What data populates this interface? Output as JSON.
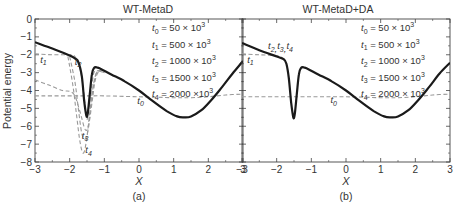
{
  "chart_data": [
    {
      "panel": "a",
      "type": "line",
      "title": "WT-MetaD",
      "caption": "(a)",
      "xlabel": "X",
      "ylabel": "Potential energy",
      "xlim": [
        -3,
        3
      ],
      "ylim": [
        -8,
        0
      ],
      "xticks": [
        -3,
        -2,
        -1,
        0,
        1,
        2,
        3
      ],
      "yticks": [
        0,
        -1,
        -2,
        -3,
        -4,
        -5,
        -6,
        -7,
        -8
      ],
      "grid": false,
      "legend": {
        "position": "upper right (text only)",
        "entries": [
          {
            "sym": "t",
            "sub": "0",
            "text": " = 50 × 10",
            "sup": "3"
          },
          {
            "sym": "t",
            "sub": "1",
            "text": " = 500 × 10",
            "sup": "3"
          },
          {
            "sym": "t",
            "sub": "2",
            "text": " = 1000 × 10",
            "sup": "3"
          },
          {
            "sym": "t",
            "sub": "3",
            "text": " = 1500 × 10",
            "sup": "3"
          },
          {
            "sym": "t",
            "sub": "4",
            "text": " = 2000 ×10",
            "sup": "3"
          }
        ]
      },
      "annotations": [
        {
          "label": "t1",
          "x": -2.85,
          "y": -2.45
        },
        {
          "label": "t2",
          "x": -1.85,
          "y": -2.55
        },
        {
          "label": "t3",
          "x": -1.65,
          "y": -6.7
        },
        {
          "label": "t4",
          "x": -1.55,
          "y": -7.5
        },
        {
          "label": "t0",
          "x": -0.05,
          "y": -4.75
        }
      ],
      "series": [
        {
          "name": "true potential",
          "style": "solid",
          "color": "#1a1a1a",
          "width": 2.2,
          "x": [
            -3.0,
            -2.5,
            -2.0,
            -1.85,
            -1.75,
            -1.65,
            -1.58,
            -1.52,
            -1.48,
            -1.42,
            -1.36,
            -1.3,
            -1.22,
            -1.1,
            -0.8,
            -0.4,
            0.0,
            0.4,
            0.8,
            1.1,
            1.3,
            1.5,
            1.8,
            2.1,
            2.4,
            2.7,
            3.0
          ],
          "y": [
            -1.3,
            -1.65,
            -2.05,
            -2.2,
            -2.4,
            -3.2,
            -4.6,
            -5.4,
            -5.3,
            -4.2,
            -3.1,
            -2.75,
            -2.7,
            -2.8,
            -3.1,
            -3.5,
            -4.0,
            -4.6,
            -5.15,
            -5.45,
            -5.5,
            -5.45,
            -5.1,
            -4.5,
            -3.8,
            -3.05,
            -2.35
          ]
        },
        {
          "name": "t0",
          "style": "dashed",
          "color": "#999999",
          "width": 1.1,
          "x": [
            -3.0,
            -2.0,
            -1.5,
            -1.0,
            0.0,
            1.0,
            1.5,
            2.0,
            2.5,
            3.0
          ],
          "y": [
            -4.3,
            -4.3,
            -4.3,
            -4.3,
            -4.35,
            -4.4,
            -4.4,
            -4.35,
            -4.25,
            -4.2
          ]
        },
        {
          "name": "t1",
          "style": "dashed",
          "color": "#999999",
          "width": 1.1,
          "x": [
            -3.0,
            -2.5,
            -2.0,
            -1.85,
            -1.7,
            -1.6,
            -1.5,
            -1.42,
            -1.35,
            -1.3,
            -1.2,
            -1.0
          ],
          "y": [
            -1.95,
            -2.0,
            -2.0,
            -2.1,
            -2.8,
            -4.0,
            -5.6,
            -4.6,
            -3.6,
            -3.0,
            -2.9,
            -3.0
          ]
        },
        {
          "name": "t2",
          "style": "dashed",
          "color": "#999999",
          "width": 1.1,
          "x": [
            -3.0,
            -2.6,
            -2.2,
            -2.0,
            -1.85,
            -1.7,
            -1.55,
            -1.45,
            -1.35,
            -1.28,
            -1.2,
            -1.1,
            -1.0
          ],
          "y": [
            -3.4,
            -3.7,
            -4.0,
            -4.05,
            -4.3,
            -5.2,
            -6.2,
            -5.9,
            -4.6,
            -3.6,
            -3.05,
            -2.95,
            -3.0
          ]
        },
        {
          "name": "t3",
          "style": "dashed",
          "color": "#999999",
          "width": 1.1,
          "x": [
            -2.0,
            -1.85,
            -1.75,
            -1.65,
            -1.55,
            -1.45,
            -1.38,
            -1.3,
            -1.22,
            -1.1
          ],
          "y": [
            -2.1,
            -3.5,
            -5.0,
            -6.4,
            -6.7,
            -6.0,
            -4.6,
            -3.6,
            -3.0,
            -2.9
          ]
        },
        {
          "name": "t4",
          "style": "dashed",
          "color": "#999999",
          "width": 1.1,
          "x": [
            -2.05,
            -1.9,
            -1.8,
            -1.7,
            -1.6,
            -1.5,
            -1.42,
            -1.34,
            -1.26,
            -1.18,
            -1.05
          ],
          "y": [
            -2.1,
            -3.8,
            -5.4,
            -6.9,
            -7.5,
            -6.6,
            -5.2,
            -4.0,
            -3.2,
            -2.9,
            -2.9
          ]
        }
      ]
    },
    {
      "panel": "b",
      "type": "line",
      "title": "WT-MetaD+DA",
      "caption": "(b)",
      "xlabel": "X",
      "ylabel": "",
      "xlim": [
        -3,
        3
      ],
      "ylim": [
        -8,
        0
      ],
      "xticks": [
        -3,
        -2,
        -1,
        0,
        1,
        2,
        3
      ],
      "yticks": [
        0,
        -1,
        -2,
        -3,
        -4,
        -5,
        -6,
        -7,
        -8
      ],
      "grid": false,
      "legend": {
        "position": "upper right (text only)",
        "entries": [
          {
            "sym": "t",
            "sub": "0",
            "text": " = 50 × 10",
            "sup": "3"
          },
          {
            "sym": "t",
            "sub": "1",
            "text": " = 500 × 10",
            "sup": "3"
          },
          {
            "sym": "t",
            "sub": "2",
            "text": " = 1000 × 10",
            "sup": "3"
          },
          {
            "sym": "t",
            "sub": "3",
            "text": " = 1500 × 10",
            "sup": "3"
          },
          {
            "sym": "t",
            "sub": "4",
            "text": " = 2000 × 10",
            "sup": "3"
          }
        ]
      },
      "annotations": [
        {
          "label": "t2,t3,t4",
          "x": -2.25,
          "y": -1.7
        },
        {
          "label": "t1",
          "x": -2.85,
          "y": -2.45
        },
        {
          "label": "t0",
          "x": -0.45,
          "y": -4.7
        }
      ],
      "series": [
        {
          "name": "t2,t3,t4 (overlapping true potential)",
          "style": "solid",
          "color": "#1a1a1a",
          "width": 2.2,
          "x": [
            -3.0,
            -2.5,
            -2.0,
            -1.8,
            -1.72,
            -1.65,
            -1.58,
            -1.52,
            -1.48,
            -1.42,
            -1.36,
            -1.3,
            -1.22,
            -1.1,
            -0.8,
            -0.4,
            0.0,
            0.4,
            0.8,
            1.1,
            1.3,
            1.5,
            1.8,
            2.1,
            2.4,
            2.7,
            3.0
          ],
          "y": [
            -1.35,
            -1.75,
            -2.1,
            -2.25,
            -2.5,
            -3.3,
            -4.7,
            -5.5,
            -5.35,
            -4.2,
            -3.1,
            -2.75,
            -2.7,
            -2.8,
            -3.1,
            -3.5,
            -4.0,
            -4.6,
            -5.15,
            -5.45,
            -5.5,
            -5.45,
            -5.1,
            -4.5,
            -3.8,
            -3.05,
            -2.45
          ]
        },
        {
          "name": "t0",
          "style": "dashed",
          "color": "#999999",
          "width": 1.1,
          "x": [
            -3.0,
            -2.0,
            -1.0,
            0.0,
            1.0,
            1.5,
            2.0,
            2.5,
            3.0
          ],
          "y": [
            -4.35,
            -4.35,
            -4.35,
            -4.35,
            -4.4,
            -4.4,
            -4.35,
            -4.25,
            -4.2
          ]
        },
        {
          "name": "t1",
          "style": "dashed",
          "color": "#999999",
          "width": 1.1,
          "x": [
            -3.0,
            -2.5,
            -2.0,
            -1.85,
            -1.75
          ],
          "y": [
            -1.95,
            -2.0,
            -2.05,
            -2.15,
            -2.3
          ]
        }
      ]
    }
  ]
}
